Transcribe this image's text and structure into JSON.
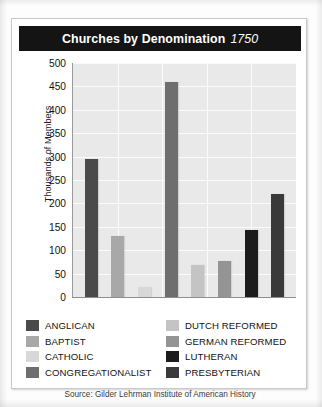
{
  "figure": {
    "title_main": "Churches by Denomination",
    "title_year": "1750",
    "source": "Source: Gilder Lehrman Institute of American History"
  },
  "chart_data": {
    "type": "bar",
    "title": "Churches by Denomination 1750",
    "xlabel": "",
    "ylabel": "Thousands of Members",
    "ylim": [
      0,
      500
    ],
    "yticks": [
      500,
      450,
      400,
      350,
      300,
      250,
      200,
      150,
      100,
      50,
      0
    ],
    "grid": true,
    "legend_position": "below",
    "categories": [
      "ANGLICAN",
      "BAPTIST",
      "CATHOLIC",
      "CONGREGATIONALIST",
      "DUTCH REFORMED",
      "GERMAN REFORMED",
      "LUTHERAN",
      "PRESBYTERIAN"
    ],
    "values": [
      295,
      130,
      22,
      460,
      68,
      78,
      143,
      220
    ],
    "colors": [
      "#4a4a4a",
      "#a8a8a8",
      "#d8d8d8",
      "#6e6e6e",
      "#c4c4c4",
      "#949494",
      "#1c1c1c",
      "#3a3a3a"
    ]
  },
  "legend": {
    "column_left": [
      {
        "label": "ANGLICAN",
        "color": "#4a4a4a"
      },
      {
        "label": "BAPTIST",
        "color": "#a8a8a8"
      },
      {
        "label": "CATHOLIC",
        "color": "#d8d8d8"
      },
      {
        "label": "CONGREGATIONALIST",
        "color": "#6e6e6e"
      }
    ],
    "column_right": [
      {
        "label": "DUTCH REFORMED",
        "color": "#c4c4c4"
      },
      {
        "label": "GERMAN REFORMED",
        "color": "#949494"
      },
      {
        "label": "LUTHERAN",
        "color": "#1c1c1c"
      },
      {
        "label": "PRESBYTERIAN",
        "color": "#3a3a3a"
      }
    ]
  },
  "theme": {
    "title_bar_bg": "#141414",
    "title_bar_fg": "#ffffff",
    "plot_bg": "#e9e9e9",
    "gridline": "#fbfbfb",
    "card_bg": "#ffffff"
  }
}
